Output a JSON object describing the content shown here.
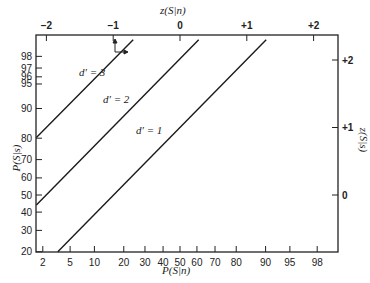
{
  "chart_data": {
    "type": "line",
    "title": "",
    "xlabel": "P(S|n)",
    "ylabel": "P(S|s)",
    "x2label": "z(S|n)",
    "y2label": "z(S|s)",
    "x_ticks": [
      2,
      5,
      10,
      20,
      30,
      40,
      50,
      60,
      70,
      80,
      90,
      95,
      98
    ],
    "y_ticks": [
      20,
      30,
      40,
      50,
      60,
      70,
      80,
      90,
      95,
      96,
      97,
      98
    ],
    "x2_ticks": [
      "-2",
      "-1",
      "0",
      "+1",
      "+2"
    ],
    "y2_ticks": [
      "0",
      "+1",
      "+2"
    ],
    "x_range_z": [
      -2.15,
      2.38
    ],
    "y_range_z": [
      -0.84,
      2.38
    ],
    "grid": false,
    "series": [
      {
        "name": "d' = 3",
        "label": "d′ = 3",
        "d_prime": 3,
        "points_z": [
          [
            -2.15,
            0.85
          ],
          [
            -0.7,
            2.3
          ]
        ],
        "points_pct": [
          [
            1.6,
            80.2
          ],
          [
            24.2,
            98.9
          ]
        ]
      },
      {
        "name": "d' = 2",
        "label": "d′ = 2",
        "d_prime": 2,
        "points_z": [
          [
            -2.15,
            -0.15
          ],
          [
            0.28,
            2.3
          ]
        ],
        "points_pct": [
          [
            1.6,
            44.0
          ],
          [
            61.0,
            98.9
          ]
        ]
      },
      {
        "name": "d' = 1",
        "label": "d′ = 1",
        "d_prime": 1,
        "points_z": [
          [
            -1.83,
            -0.84
          ],
          [
            1.29,
            2.3
          ]
        ],
        "points_pct": [
          [
            3.4,
            20.0
          ],
          [
            90.2,
            98.9
          ]
        ]
      }
    ],
    "annotation": "Arrow markers at z(S|n) = -1, z(S|s) = +2 on the d' = 3 line"
  },
  "axes": {
    "bottom_title": "P(S|n)",
    "left_title": "P(S|s)",
    "top_title": "z(S|n)",
    "right_title": "z(S|s)"
  },
  "labels": {
    "d3": "d′ = 3",
    "d2": "d′ = 2",
    "d1": "d′ = 1"
  }
}
